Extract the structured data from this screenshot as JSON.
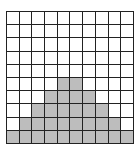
{
  "label": "",
  "grid": {
    "columns": 10,
    "rows": 10,
    "fill_color": "#bdbdbd",
    "line_color": "#222222",
    "column_heights": [
      1,
      2,
      3,
      4,
      5,
      5,
      4,
      3,
      2,
      1
    ]
  }
}
